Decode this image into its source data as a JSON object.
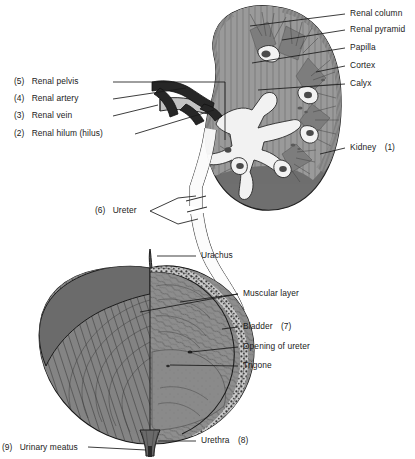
{
  "diagram": {
    "colors": {
      "ink": "#1a1a1a",
      "kidney_outer": "#7a7a7a",
      "kidney_cortex": "#9a9a9a",
      "kidney_medulla": "#8a8a8a",
      "pelvis_white": "#f4f4f4",
      "artery_dark": "#232323",
      "vein_grey": "#b9b9b9",
      "bladder_muscle": "#808080",
      "bladder_mucosa": "#8c8c8c",
      "bladder_wall_dark": "#5f5f5f",
      "background": "#ffffff"
    },
    "labels_right_kidney": [
      {
        "id": "renal-column",
        "text": "Renal column",
        "number": ""
      },
      {
        "id": "renal-pyramid",
        "text": "Renal pyramid",
        "number": ""
      },
      {
        "id": "papilla",
        "text": "Papilla",
        "number": ""
      },
      {
        "id": "cortex",
        "text": "Cortex",
        "number": ""
      },
      {
        "id": "calyx",
        "text": "Calyx",
        "number": ""
      },
      {
        "id": "kidney",
        "text": "Kidney",
        "number": "(1)"
      }
    ],
    "labels_left_kidney": [
      {
        "id": "renal-pelvis",
        "number": "(5)",
        "text": "Renal pelvis"
      },
      {
        "id": "renal-artery",
        "number": "(4)",
        "text": "Renal artery"
      },
      {
        "id": "renal-vein",
        "number": "(3)",
        "text": "Renal vein"
      },
      {
        "id": "renal-hilum",
        "number": "(2)",
        "text": "Renal hilum (hilus)"
      },
      {
        "id": "ureter",
        "number": "(6)",
        "text": "Ureter"
      }
    ],
    "labels_bladder": [
      {
        "id": "urachus",
        "text": "Urachus",
        "number": ""
      },
      {
        "id": "muscular-layer",
        "text": "Muscular layer",
        "number": ""
      },
      {
        "id": "bladder",
        "text": "Bladder",
        "number": "(7)"
      },
      {
        "id": "opening-of-ureter",
        "text": "Opening of ureter",
        "number": ""
      },
      {
        "id": "trigone",
        "text": "Trigone",
        "number": ""
      },
      {
        "id": "urethra",
        "text": "Urethra",
        "number": "(8)"
      },
      {
        "id": "urinary-meatus",
        "number": "(9)",
        "text": "Urinary meatus"
      }
    ]
  }
}
